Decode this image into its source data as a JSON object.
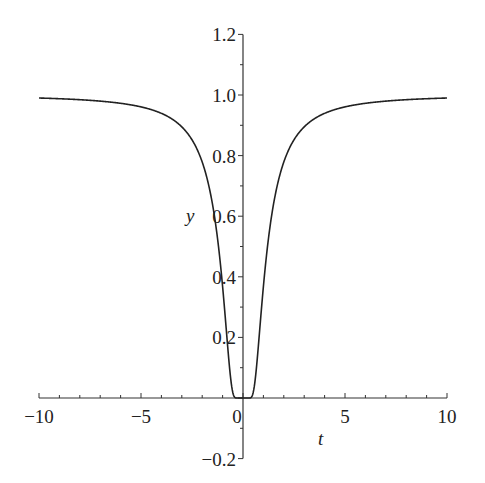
{
  "chart_data": {
    "type": "line",
    "title": "",
    "xlabel": "t",
    "ylabel": "y",
    "xlim": [
      -10,
      10
    ],
    "ylim": [
      -0.2,
      1.2
    ],
    "x_ticks": [
      -10,
      -5,
      0,
      5,
      10
    ],
    "x_tick_labels": [
      "−10",
      "−5",
      "0",
      "5",
      "10"
    ],
    "y_ticks": [
      -0.2,
      0.2,
      0.4,
      0.6,
      0.8,
      1.0,
      1.2
    ],
    "y_tick_labels": [
      "−0.2",
      "0.2",
      "0.4",
      "0.6",
      "0.8",
      "1.0",
      "1.2"
    ],
    "grid": false,
    "legend": null,
    "series": [
      {
        "name": "y = exp(-1/t^2)",
        "color": "#222222",
        "x": [
          -10,
          -8,
          -6,
          -5,
          -4,
          -3,
          -2.5,
          -2,
          -1.5,
          -1.25,
          -1,
          -0.8,
          -0.6,
          -0.5,
          -0.4,
          -0.3,
          0,
          0.3,
          0.4,
          0.5,
          0.6,
          0.8,
          1,
          1.25,
          1.5,
          2,
          2.5,
          3,
          4,
          5,
          6,
          8,
          10
        ],
        "values": [
          0.99,
          0.984,
          0.973,
          0.961,
          0.939,
          0.895,
          0.852,
          0.779,
          0.641,
          0.527,
          0.368,
          0.21,
          0.062,
          0.018,
          0.002,
          0.0,
          0.0,
          0.0,
          0.002,
          0.018,
          0.062,
          0.21,
          0.368,
          0.527,
          0.641,
          0.779,
          0.852,
          0.895,
          0.939,
          0.961,
          0.973,
          0.984,
          0.99
        ]
      }
    ]
  },
  "axes": {
    "x_label": "t",
    "y_label": "y"
  }
}
